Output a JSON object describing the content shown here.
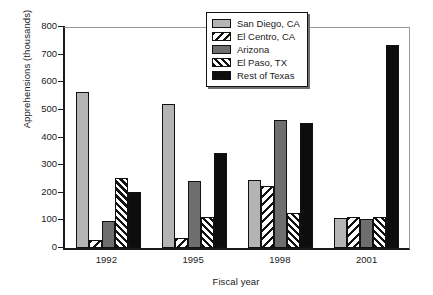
{
  "chart_data": {
    "type": "bar",
    "title": "",
    "xlabel": "Fiscal year",
    "ylabel": "Apprehensions (thousands)",
    "ylim": [
      0,
      800
    ],
    "yticks": [
      0,
      100,
      200,
      300,
      400,
      500,
      600,
      700,
      800
    ],
    "grid": false,
    "legend_position": "top-right",
    "categories": [
      "1992",
      "1995",
      "1998",
      "2001"
    ],
    "series": [
      {
        "name": "San Diego, CA",
        "color": "#b4b4b4",
        "pattern": "solid",
        "values": [
          565,
          522,
          248,
          108
        ]
      },
      {
        "name": "El Centro, CA",
        "color": "#ffffff",
        "pattern": "diagonal-sparse",
        "values": [
          30,
          37,
          225,
          112
        ]
      },
      {
        "name": "Arizona",
        "color": "#6e6e6e",
        "pattern": "solid",
        "values": [
          97,
          243,
          463,
          105
        ]
      },
      {
        "name": "El Paso, TX",
        "color": "#ffffff",
        "pattern": "diagonal-dense",
        "values": [
          252,
          112,
          125,
          112
        ]
      },
      {
        "name": "Rest of Texas",
        "color": "#0d0d0d",
        "pattern": "solid",
        "values": [
          202,
          345,
          452,
          735
        ]
      }
    ]
  }
}
